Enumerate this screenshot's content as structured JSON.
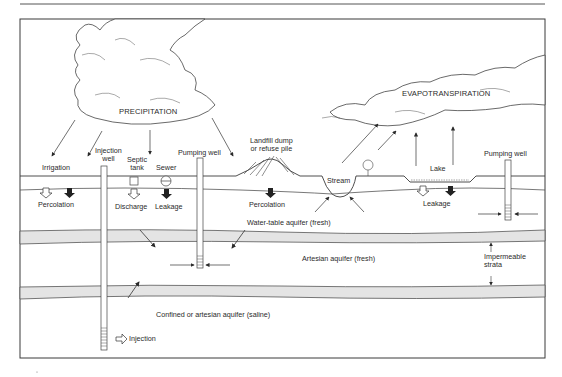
{
  "diagram": {
    "type": "groundwater contamination cross-section",
    "colors": {
      "line": "#3a3a3a",
      "aquifer_band": "#e4e4e4",
      "background": "#ffffff"
    },
    "sky": {
      "precipitation_label": "PRECIPITATION",
      "evapotranspiration_label": "EVAPOTRANSPIRATION"
    },
    "surface": {
      "irrigation": "Irrigation",
      "injection_well": [
        "Injection",
        "well"
      ],
      "septic_tank": [
        "Septic",
        "tank"
      ],
      "sewer": "Sewer",
      "pumping_well_left": "Pumping well",
      "landfill": [
        "Landfill dump",
        "or refuse pile"
      ],
      "stream": "Stream",
      "lake": "Lake",
      "pumping_well_right": "Pumping well"
    },
    "subsurface": {
      "percolation_left": "Percolation",
      "discharge": "Discharge",
      "leakage_sewer": "Leakage",
      "percolation_landfill": "Percolation",
      "leakage_lake": "Leakage",
      "water_table_aquifer": "Water-table aquifer (fresh)",
      "artesian_aquifer": "Artesian aquifer (fresh)",
      "impermeable_strata": [
        "Impermeable",
        "strata"
      ],
      "confined_aquifer": "Confined or artesian aquifer (saline)",
      "injection": "Injection"
    },
    "icons": {
      "percolation_hollow": "hollow-down-arrow-icon",
      "percolation_solid": "solid-down-arrow-icon",
      "septic_tank": "square-tank-icon",
      "sewer": "circle-pipe-icon",
      "injection": "hollow-right-arrow-icon",
      "tree": "tree-icon",
      "well_screen": "well-screen-icon"
    }
  }
}
